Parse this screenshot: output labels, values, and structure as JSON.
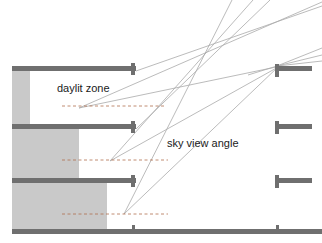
{
  "figure": {
    "type": "architectural-section-diagram",
    "title_visible": false,
    "background_color": "#ffffff"
  },
  "labels": {
    "daylit_zone": "daylit zone",
    "sky_view_angle": "sky view angle"
  },
  "colors": {
    "slab": "#6f6f6f",
    "slab_dark": "#636363",
    "zone_fill": "#c9c9c9",
    "ray_line": "#a9a9a9",
    "dashed_line": "#b0704f",
    "text": "#1a1a1a",
    "background": "#ffffff"
  },
  "geometry": {
    "canvas": {
      "width": 322,
      "height": 243
    },
    "left_building": {
      "name": "left-building",
      "facade_x": 136,
      "wall_x": 12,
      "slabs": [
        {
          "name": "roof-slab",
          "y": 66,
          "x1": 12,
          "x2": 136,
          "thickness": 5,
          "tick_height": 11
        },
        {
          "name": "floor-slab-2",
          "y": 124,
          "x1": 12,
          "x2": 136,
          "thickness": 5,
          "tick_height": 11
        },
        {
          "name": "floor-slab-1",
          "y": 178,
          "x1": 12,
          "x2": 136,
          "thickness": 5,
          "tick_height": 11
        },
        {
          "name": "ground-slab",
          "y": 229,
          "x1": 12,
          "x2": 322,
          "thickness": 5,
          "tick_height": 7
        }
      ],
      "zones": [
        {
          "name": "daylit-zone-top",
          "x1": 12,
          "y1": 71,
          "x2": 30,
          "y2": 124
        },
        {
          "name": "daylit-zone-middle",
          "x1": 12,
          "y1": 129,
          "x2": 79,
          "y2": 178
        },
        {
          "name": "daylit-zone-bottom",
          "x1": 12,
          "y1": 183,
          "x2": 107,
          "y2": 229
        }
      ]
    },
    "right_building": {
      "name": "right-building",
      "facade_x": 277,
      "slabs": [
        {
          "name": "right-slab-3",
          "y": 68,
          "x1": 277,
          "x2": 312,
          "thickness": 5,
          "tick_height": 13
        },
        {
          "name": "right-slab-2",
          "y": 124,
          "x1": 277,
          "x2": 312,
          "thickness": 5,
          "tick_height": 13
        },
        {
          "name": "right-slab-1",
          "y": 178,
          "x1": 277,
          "x2": 312,
          "thickness": 5,
          "tick_height": 13
        }
      ]
    },
    "dashed_zone_lines": [
      {
        "name": "dashed-line-top",
        "y": 106,
        "x1": 62,
        "x2": 166
      },
      {
        "name": "dashed-line-middle",
        "y": 160,
        "x1": 62,
        "x2": 168
      },
      {
        "name": "dashed-line-bottom",
        "y": 214,
        "x1": 62,
        "x2": 168
      }
    ],
    "sky_view_rays": [
      {
        "name": "ray-top-1",
        "x1": 79,
        "y1": 108,
        "x2": 322,
        "y2": 2
      },
      {
        "name": "ray-top-2",
        "x1": 79,
        "y1": 108,
        "x2": 280,
        "y2": 66
      },
      {
        "name": "ray-mid-1",
        "x1": 110,
        "y1": 161,
        "x2": 250,
        "y2": 0
      },
      {
        "name": "ray-mid-2",
        "x1": 110,
        "y1": 161,
        "x2": 279,
        "y2": 66
      },
      {
        "name": "ray-bot-1",
        "x1": 124,
        "y1": 214,
        "x2": 230,
        "y2": 0
      },
      {
        "name": "ray-bot-2",
        "x1": 124,
        "y1": 214,
        "x2": 278,
        "y2": 66
      },
      {
        "name": "ray-fan-1",
        "x1": 277,
        "y1": 66,
        "x2": 322,
        "y2": 50
      },
      {
        "name": "ray-fan-2",
        "x1": 277,
        "y1": 66,
        "x2": 322,
        "y2": 56
      },
      {
        "name": "ray-fan-3",
        "x1": 277,
        "y1": 66,
        "x2": 322,
        "y2": 62
      },
      {
        "name": "ray-upper-1",
        "x1": 136,
        "y1": 71,
        "x2": 322,
        "y2": 8
      },
      {
        "name": "ray-upper-2",
        "x1": 136,
        "y1": 129,
        "x2": 268,
        "y2": 0
      }
    ],
    "label_positions": {
      "daylit_zone": {
        "x": 57,
        "y": 89
      },
      "sky_view_angle": {
        "x": 167,
        "y": 144
      }
    }
  }
}
